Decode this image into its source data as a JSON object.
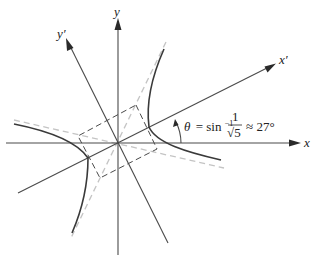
{
  "diagram": {
    "labels": {
      "x_axis": "x",
      "y_axis": "y",
      "x_prime_axis": "x′",
      "y_prime_axis": "y′"
    },
    "angle_annotation": {
      "theta": "θ",
      "equals": "= sin",
      "inverse": "−1",
      "numerator": "1",
      "denominator": "√5",
      "approx": "≈ 27°"
    },
    "rotation_angle_degrees": 27,
    "colors": {
      "axes": "#4a4a4a",
      "hyperbola": "#3a3a3a",
      "asymptotes": "#c4c4c4",
      "box": "#4a4a4a"
    }
  }
}
